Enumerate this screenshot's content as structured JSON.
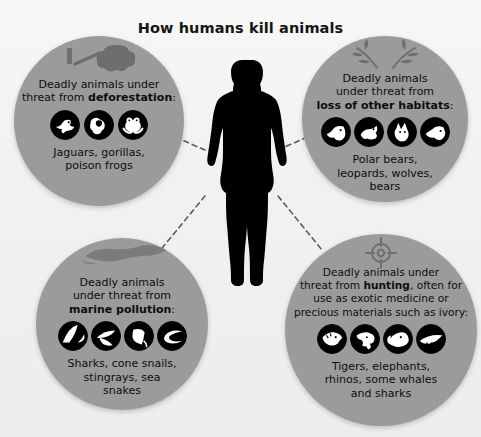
{
  "page": {
    "title": "How humans kill animals",
    "background_color": "#f2f2f0",
    "bubble_color": "#9b9b9b",
    "silhouette_color": "#000000",
    "text_color": "#0d0d0d",
    "connector_style": "dashed"
  },
  "center": {
    "figure_name": "human-silhouette"
  },
  "bubbles": [
    {
      "id": "deforestation",
      "position": "top-left",
      "deco_icon": "felled-tree-icon",
      "text_lines": [
        "Deadly animals under",
        "threat from "
      ],
      "text_plain": "Deadly animals under threat from deforestation:",
      "emphasis": "deforestation",
      "emphasis_suffix": ":",
      "icons": [
        "jaguar-icon",
        "gorilla-icon",
        "poison-frog-icon"
      ],
      "caption": "Jaguars, gorillas, poison frogs",
      "caption_lines": [
        "Jaguars, gorillas,",
        "poison frogs"
      ]
    },
    {
      "id": "habitat-loss",
      "position": "top-right",
      "deco_icon": "leafy-branches-icon",
      "text_lines": [
        "Deadly animals",
        "under threat from"
      ],
      "text_plain": "Deadly animals under threat from loss of other habitats:",
      "emphasis": "loss of other habitats",
      "emphasis_suffix": ":",
      "icons": [
        "polar-bear-icon",
        "leopard-icon",
        "wolf-icon",
        "bear-icon"
      ],
      "caption": "Polar bears, leopards, wolves, bears",
      "caption_lines": [
        "Polar bears,",
        "leopards, wolves,",
        "bears"
      ]
    },
    {
      "id": "marine-pollution",
      "position": "bottom-left",
      "deco_icon": "oil-slick-icon",
      "text_lines": [
        "Deadly animals",
        "under threat from"
      ],
      "text_plain": "Deadly animals under threat from marine pollution:",
      "emphasis": "marine pollution",
      "emphasis_suffix": ":",
      "icons": [
        "shark-icon",
        "cone-snail-icon",
        "stingray-icon",
        "sea-snake-icon"
      ],
      "caption": "Sharks, cone snails, stingrays, sea snakes",
      "caption_lines": [
        "Sharks, cone snails,",
        "stingrays, sea",
        "snakes"
      ]
    },
    {
      "id": "hunting",
      "position": "bottom-right",
      "deco_icon": "crosshair-target-icon",
      "text_lines": [
        "Deadly animals under",
        "threat from "
      ],
      "text_plain": "Deadly animals under threat from hunting, often for use as exotic medicine or precious materials such as ivory:",
      "emphasis": "hunting",
      "emphasis_suffix": ", often for",
      "text_tail_lines": [
        "use as exotic medicine or",
        "precious materials such as ivory:"
      ],
      "icons": [
        "tiger-icon",
        "elephant-icon",
        "rhino-icon",
        "shark-icon"
      ],
      "caption": "Tigers, elephants, rhinos, some whales and sharks",
      "caption_lines": [
        "Tigers, elephants,",
        "rhinos, some whales",
        "and sharks"
      ]
    }
  ]
}
